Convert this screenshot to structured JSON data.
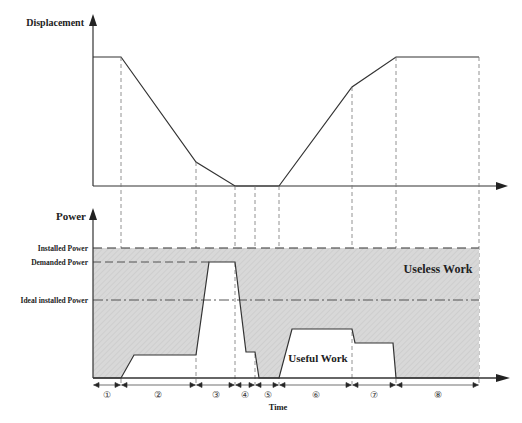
{
  "diagram": {
    "top_panel": {
      "y_axis_label": "Displacement"
    },
    "bottom_panel": {
      "y_axis_label": "Power",
      "x_axis_label": "Time",
      "levels": {
        "installed_power": "Installed Power",
        "demanded_power": "Demanded Power",
        "ideal_installed_power": "Ideal installed Power"
      },
      "regions": {
        "useless_work": "Useless Work",
        "useful_work": "Useful Work"
      },
      "phases": [
        "①",
        "②",
        "③",
        "④",
        "⑤",
        "⑥",
        "⑦",
        "⑧"
      ]
    },
    "colors": {
      "line": "#333333",
      "shade": "#d6d6d6",
      "dash": "#555555"
    }
  }
}
